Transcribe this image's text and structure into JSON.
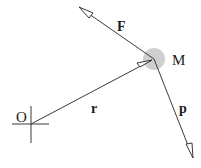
{
  "diagram": {
    "labels": {
      "origin": "O",
      "mass": "M",
      "position": "r",
      "force": "F",
      "momentum": "p"
    },
    "colors": {
      "line": "#3a3a3a",
      "mass_fill": "#cfcfcf",
      "text": "#1a1a1a"
    }
  }
}
